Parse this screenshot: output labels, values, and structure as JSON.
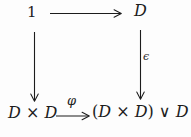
{
  "diagram": {
    "nodes": {
      "top_left": {
        "label": "1"
      },
      "top_right": {
        "label": "D"
      },
      "bottom_left": {
        "parts": [
          "D",
          " × ",
          "D"
        ]
      },
      "bottom_right": {
        "parts": [
          "(",
          "D",
          " × ",
          "D",
          ")",
          " ∨ ",
          "D"
        ]
      }
    },
    "arrows": {
      "top": {
        "from": "1",
        "to": "D",
        "label": ""
      },
      "left": {
        "from": "1",
        "to": "D × D",
        "label": ""
      },
      "right": {
        "from": "D",
        "to": "(D × D) ∨ D",
        "label": "ϵ"
      },
      "bottom": {
        "from": "D × D",
        "to": "(D × D) ∨ D",
        "label": "φ"
      }
    }
  },
  "colors": {
    "ink": "#1c1c1c",
    "background": "#fdfdfd"
  }
}
